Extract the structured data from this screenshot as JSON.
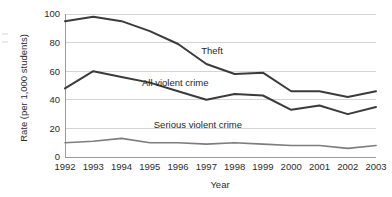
{
  "chart_data": {
    "type": "line",
    "title": "",
    "xlabel": "Year",
    "ylabel": "Rate (per 1,000 students)",
    "categories": [
      "1992",
      "1993",
      "1994",
      "1995",
      "1996",
      "1997",
      "1998",
      "1999",
      "2000",
      "2001",
      "2002",
      "2003"
    ],
    "x": [
      1992,
      1993,
      1994,
      1995,
      1996,
      1997,
      1998,
      1999,
      2000,
      2001,
      2002,
      2003
    ],
    "xlim": [
      1992,
      2003
    ],
    "ylim": [
      0,
      100
    ],
    "yticks": [
      0,
      20,
      40,
      60,
      80,
      100
    ],
    "ytick_labels": [
      "0",
      "20",
      "40",
      "60",
      "80",
      "100"
    ],
    "grid": "horizontal",
    "legend": "inline-annotations",
    "series": [
      {
        "name": "Theft",
        "color": "#3b3b3b",
        "width": 2.0,
        "values": [
          95,
          98,
          95,
          88,
          79,
          65,
          58,
          59,
          46,
          46,
          42,
          46
        ],
        "label_x": 1997.2,
        "label_y": 72
      },
      {
        "name": "All violent crime",
        "color": "#3b3b3b",
        "width": 2.0,
        "values": [
          48,
          60,
          56,
          52,
          46,
          40,
          44,
          43,
          33,
          36,
          30,
          35
        ],
        "label_x": 1995.9,
        "label_y": 50
      },
      {
        "name": "Serious violent crime",
        "color": "#7d7d7d",
        "width": 1.6,
        "values": [
          10,
          11,
          13,
          10,
          10,
          9,
          10,
          9,
          8,
          8,
          6,
          8
        ],
        "label_x": 1996.7,
        "label_y": 20
      }
    ]
  },
  "annotations": {
    "theft": "Theft",
    "all_violent": "All violent crime",
    "serious_violent": "Serious violent crime"
  },
  "axes": {
    "x_title": "Year",
    "y_title": "Rate (per 1,000 students)"
  },
  "colors": {
    "theft": "#3b3b3b",
    "all_violent": "#3b3b3b",
    "serious_violent": "#7d7d7d",
    "gridline": "#c9c9c9",
    "axis": "#8f8f8f",
    "text": "#2b2b2b",
    "background": "#ffffff"
  }
}
